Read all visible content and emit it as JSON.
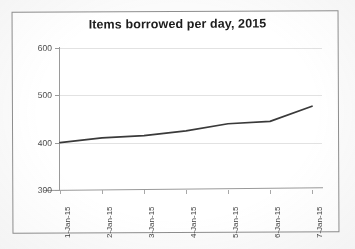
{
  "chart_data": {
    "type": "line",
    "title": "Items borrowed per day, 2015",
    "xlabel": "",
    "ylabel": "",
    "categories": [
      "1-Jan-15",
      "2-Jan-15",
      "3-Jan-15",
      "4-Jan-15",
      "5-Jan-15",
      "6-Jan-15",
      "7-Jan-15"
    ],
    "series": [
      {
        "name": "Items borrowed",
        "values": [
          400,
          410,
          415,
          425,
          440,
          445,
          477
        ],
        "color": "#3a3a3a"
      }
    ],
    "ylim": [
      300,
      600
    ],
    "yticks": [
      300,
      400,
      500,
      600
    ],
    "ytick_labels": [
      "300",
      "400",
      "500",
      "600"
    ],
    "grid": true,
    "legend": false,
    "legend_position": "none",
    "markers": false,
    "xtick_label_rotation": -90
  },
  "style": {
    "plot_background": "#ffffff",
    "frame_border": "#8e8e8e",
    "gridline_color": "#e2e2e2",
    "axis_color": "#9a9a9a",
    "title_color": "#1d1d1d",
    "tick_label_color": "#4a4a4a"
  }
}
